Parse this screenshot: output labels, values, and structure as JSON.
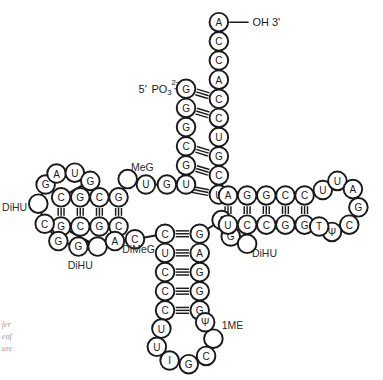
{
  "figure": {
    "background_color": "#ffffff",
    "stroke_color": "#1a1a1a",
    "circle_radius": 10.2
  },
  "end_labels": {
    "three_prime": "OH 3'",
    "five_prime_prefix": "5'",
    "five_prime_group": "PO",
    "five_prime_subscript": "3",
    "five_prime_superscript": "2−"
  },
  "modified_base_labels": [
    {
      "name": "label-meg",
      "text": "MeG",
      "x": 156,
      "y": 175
    },
    {
      "name": "label-dimeg",
      "text": "DiMeG",
      "x": 152,
      "y": 265
    },
    {
      "name": "label-dihu-left",
      "text": "DiHU",
      "x": 16,
      "y": 219
    },
    {
      "name": "label-dihu-bottom",
      "text": "DiHU",
      "x": 88,
      "y": 283
    },
    {
      "name": "label-dihu-right",
      "text": "DiHU",
      "x": 290,
      "y": 270
    },
    {
      "name": "label-1me",
      "text": "1ME",
      "x": 255,
      "y": 349
    }
  ],
  "caption_lines": [
    {
      "text": "fer",
      "x": 2,
      "y": 348
    },
    {
      "text": "eaf",
      "x": 2,
      "y": 361
    },
    {
      "text": "ure",
      "x": 2,
      "y": 374
    }
  ],
  "chart_data": {
    "type": "diagram",
    "diagram_kind": "tRNA cloverleaf secondary structure",
    "arms": [
      {
        "name": "acceptor-stem",
        "strand_5_prime": [
          "G",
          "G",
          "G",
          "C",
          "G",
          "U",
          "G"
        ],
        "strand_3_prime": [
          "A",
          "C",
          "C",
          "A",
          "C",
          "C",
          "U",
          "G",
          "C",
          "U"
        ],
        "paired": true
      },
      {
        "name": "d-arm",
        "stem_top": [
          "C",
          "G",
          "C",
          "G"
        ],
        "stem_bottom": [
          "G",
          "C",
          "G",
          "C"
        ],
        "loop": [
          "G",
          "A",
          "U",
          "G",
          "",
          "C",
          "G",
          "G",
          ""
        ]
      },
      {
        "name": "anticodon-arm",
        "stem_left": [
          "C",
          "U",
          "C",
          "C",
          "C"
        ],
        "stem_right": [
          "G",
          "A",
          "G",
          "G",
          "G"
        ],
        "loop": [
          "U",
          "U",
          "I",
          "G",
          "C",
          "",
          "Ψ"
        ],
        "anticodon": [
          "I",
          "G",
          "C"
        ]
      },
      {
        "name": "t-arm",
        "stem_top": [
          "A",
          "G",
          "G",
          "C",
          "C"
        ],
        "stem_bottom": [
          "U",
          "C",
          "C",
          "G",
          "G"
        ],
        "loop": [
          "U",
          "U",
          "A",
          "G",
          "C",
          "Ψ",
          "T"
        ]
      }
    ],
    "nucleotides": [
      {
        "id": "a1",
        "label": "A",
        "x": 240,
        "y": 16
      },
      {
        "id": "a2",
        "label": "C",
        "x": 240,
        "y": 37
      },
      {
        "id": "a3",
        "label": "C",
        "x": 240,
        "y": 58
      },
      {
        "id": "a4",
        "label": "A",
        "x": 240,
        "y": 79
      },
      {
        "id": "a5",
        "label": "C",
        "x": 240,
        "y": 100
      },
      {
        "id": "a6",
        "label": "C",
        "x": 240,
        "y": 121
      },
      {
        "id": "a7",
        "label": "U",
        "x": 240,
        "y": 142
      },
      {
        "id": "a8",
        "label": "G",
        "x": 240,
        "y": 163
      },
      {
        "id": "a9",
        "label": "C",
        "x": 240,
        "y": 184
      },
      {
        "id": "a10",
        "label": "U",
        "x": 240,
        "y": 205
      },
      {
        "id": "b1",
        "label": "G",
        "x": 204,
        "y": 89
      },
      {
        "id": "b2",
        "label": "G",
        "x": 204,
        "y": 110
      },
      {
        "id": "b3",
        "label": "G",
        "x": 204,
        "y": 131
      },
      {
        "id": "b4",
        "label": "C",
        "x": 204,
        "y": 152
      },
      {
        "id": "b5",
        "label": "G",
        "x": 204,
        "y": 173
      },
      {
        "id": "b6",
        "label": "U",
        "x": 204,
        "y": 194
      },
      {
        "id": "b7",
        "label": "G",
        "x": 183,
        "y": 194
      },
      {
        "id": "m1",
        "label": "U",
        "x": 160,
        "y": 194
      },
      {
        "id": "m2",
        "label": "",
        "x": 140,
        "y": 188
      },
      {
        "id": "d1",
        "label": "G",
        "x": 130,
        "y": 208
      },
      {
        "id": "d2",
        "label": "C",
        "x": 109,
        "y": 208
      },
      {
        "id": "d3",
        "label": "G",
        "x": 88,
        "y": 208
      },
      {
        "id": "d4",
        "label": "C",
        "x": 67,
        "y": 208
      },
      {
        "id": "d5",
        "label": "C",
        "x": 130,
        "y": 240
      },
      {
        "id": "d6",
        "label": "G",
        "x": 109,
        "y": 240
      },
      {
        "id": "d7",
        "label": "C",
        "x": 88,
        "y": 240
      },
      {
        "id": "d8",
        "label": "G",
        "x": 67,
        "y": 240
      },
      {
        "id": "l1",
        "label": "G",
        "x": 50,
        "y": 194
      },
      {
        "id": "l2",
        "label": "A",
        "x": 62,
        "y": 182
      },
      {
        "id": "l3",
        "label": "U",
        "x": 82,
        "y": 181
      },
      {
        "id": "l4",
        "label": "G",
        "x": 99,
        "y": 190
      },
      {
        "id": "l5",
        "label": "",
        "x": 42,
        "y": 215
      },
      {
        "id": "l6",
        "label": "C",
        "x": 49,
        "y": 237
      },
      {
        "id": "l7",
        "label": "G",
        "x": 64,
        "y": 256
      },
      {
        "id": "l8",
        "label": "G",
        "x": 86,
        "y": 262
      },
      {
        "id": "l9",
        "label": "",
        "x": 107,
        "y": 262
      },
      {
        "id": "j1",
        "label": "A",
        "x": 126,
        "y": 256
      },
      {
        "id": "j2",
        "label": "C",
        "x": 148,
        "y": 254
      },
      {
        "id": "c1",
        "label": "C",
        "x": 181,
        "y": 248
      },
      {
        "id": "c2",
        "label": "U",
        "x": 181,
        "y": 269
      },
      {
        "id": "c3",
        "label": "C",
        "x": 181,
        "y": 290
      },
      {
        "id": "c4",
        "label": "C",
        "x": 181,
        "y": 311
      },
      {
        "id": "c5",
        "label": "C",
        "x": 181,
        "y": 332
      },
      {
        "id": "c6",
        "label": "G",
        "x": 219,
        "y": 248
      },
      {
        "id": "c7",
        "label": "A",
        "x": 219,
        "y": 269
      },
      {
        "id": "c8",
        "label": "G",
        "x": 219,
        "y": 290
      },
      {
        "id": "c9",
        "label": "G",
        "x": 219,
        "y": 311
      },
      {
        "id": "c10",
        "label": "G",
        "x": 219,
        "y": 332
      },
      {
        "id": "al1",
        "label": "U",
        "x": 177,
        "y": 352
      },
      {
        "id": "al2",
        "label": "U",
        "x": 172,
        "y": 372
      },
      {
        "id": "al3",
        "label": "I",
        "x": 186,
        "y": 387
      },
      {
        "id": "al4",
        "label": "G",
        "x": 207,
        "y": 391
      },
      {
        "id": "al5",
        "label": "C",
        "x": 226,
        "y": 382
      },
      {
        "id": "al6",
        "label": "",
        "x": 234,
        "y": 363
      },
      {
        "id": "al7",
        "label": "Ψ",
        "x": 225,
        "y": 345
      },
      {
        "id": "k1",
        "label": "A",
        "x": 243,
        "y": 233
      },
      {
        "id": "k2",
        "label": "G",
        "x": 253,
        "y": 251
      },
      {
        "id": "k3",
        "label": "",
        "x": 271,
        "y": 259
      },
      {
        "id": "t1",
        "label": "A",
        "x": 250,
        "y": 206
      },
      {
        "id": "t2",
        "label": "G",
        "x": 271,
        "y": 206
      },
      {
        "id": "t3",
        "label": "G",
        "x": 292,
        "y": 206
      },
      {
        "id": "t4",
        "label": "C",
        "x": 313,
        "y": 206
      },
      {
        "id": "t5",
        "label": "C",
        "x": 334,
        "y": 206
      },
      {
        "id": "t6",
        "label": "U",
        "x": 250,
        "y": 238
      },
      {
        "id": "t7",
        "label": "C",
        "x": 271,
        "y": 238
      },
      {
        "id": "t8",
        "label": "C",
        "x": 292,
        "y": 238
      },
      {
        "id": "t9",
        "label": "G",
        "x": 313,
        "y": 238
      },
      {
        "id": "t10",
        "label": "G",
        "x": 334,
        "y": 238
      },
      {
        "id": "tl1",
        "label": "U",
        "x": 354,
        "y": 200
      },
      {
        "id": "tl2",
        "label": "U",
        "x": 370,
        "y": 190
      },
      {
        "id": "tl3",
        "label": "A",
        "x": 387,
        "y": 199
      },
      {
        "id": "tl4",
        "label": "G",
        "x": 393,
        "y": 219
      },
      {
        "id": "tl5",
        "label": "C",
        "x": 383,
        "y": 238
      },
      {
        "id": "tl6",
        "label": "Ψ",
        "x": 364,
        "y": 246
      },
      {
        "id": "tl7",
        "label": "T",
        "x": 350,
        "y": 240
      }
    ],
    "backbone_paths": [
      "a1 a2 a3 a4 a5 a6 a7 a8 a9 a10",
      "b1 b2 b3 b4 b5 b6 b7 m1 m2 d1 d2 d3 d4 l1 l2 l3 l4",
      "l1 l5 l6 l7 l8 l9 d8 d7 d6 d5 j1 j2 c1 c2 c3 c4 c5",
      "c5 al1 al2 al3 al4 al5 al6 al7 c10",
      "c10 c9 c8 c7 c6 k1 k2 k3 t6 t7 t8 t9 t10",
      "t10 tl7 tl6 tl5 tl4 tl3 tl2 tl1 t5",
      "t5 t4 t3 t2 t1 a10",
      "l4 d4",
      "l9 d8"
    ],
    "base_pairs": [
      {
        "a": "b1",
        "b": "a5",
        "orient": "h"
      },
      {
        "a": "b2",
        "b": "a6",
        "orient": "h"
      },
      {
        "a": "b4",
        "b": "a8",
        "orient": "h"
      },
      {
        "a": "b5",
        "b": "a9",
        "orient": "h"
      },
      {
        "a": "b7",
        "b": "a10",
        "orient": "h"
      },
      {
        "a": "d1",
        "b": "d5",
        "orient": "v"
      },
      {
        "a": "d2",
        "b": "d6",
        "orient": "v"
      },
      {
        "a": "d3",
        "b": "d7",
        "orient": "v"
      },
      {
        "a": "d4",
        "b": "d8",
        "orient": "v"
      },
      {
        "a": "c1",
        "b": "c6",
        "orient": "h"
      },
      {
        "a": "c2",
        "b": "c7",
        "orient": "h"
      },
      {
        "a": "c3",
        "b": "c8",
        "orient": "h"
      },
      {
        "a": "c4",
        "b": "c9",
        "orient": "h"
      },
      {
        "a": "c5",
        "b": "c10",
        "orient": "h"
      },
      {
        "a": "t1",
        "b": "t6",
        "orient": "v"
      },
      {
        "a": "t2",
        "b": "t7",
        "orient": "v"
      },
      {
        "a": "t3",
        "b": "t8",
        "orient": "v"
      },
      {
        "a": "t4",
        "b": "t9",
        "orient": "v"
      },
      {
        "a": "t5",
        "b": "t10",
        "orient": "v"
      }
    ]
  }
}
